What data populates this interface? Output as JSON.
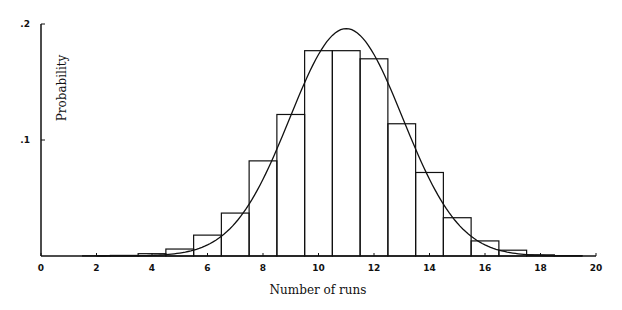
{
  "chart_data": {
    "type": "bar",
    "title": "",
    "xlabel": "Number of runs",
    "ylabel": "Probability",
    "xlim": [
      0,
      20
    ],
    "ylim": [
      0,
      0.2
    ],
    "x_ticks": [
      0,
      2,
      4,
      6,
      8,
      10,
      12,
      14,
      16,
      18,
      20
    ],
    "x_tick_labels": [
      "0",
      "2",
      "4",
      "6",
      "8",
      "10",
      "12",
      "14",
      "16",
      "18",
      "20"
    ],
    "y_ticks": [
      0.1,
      0.2
    ],
    "y_tick_labels": [
      ".1",
      ".2"
    ],
    "grid": false,
    "legend": null,
    "series": [
      {
        "name": "Observed histogram",
        "kind": "bar",
        "x": [
          2,
          3,
          4,
          5,
          6,
          7,
          8,
          9,
          10,
          11,
          12,
          13,
          14,
          15,
          16,
          17,
          18,
          19
        ],
        "values": [
          0.0002,
          0.0005,
          0.002,
          0.006,
          0.018,
          0.037,
          0.082,
          0.122,
          0.177,
          0.177,
          0.17,
          0.114,
          0.072,
          0.033,
          0.013,
          0.005,
          0.001,
          0.0003
        ]
      },
      {
        "name": "Normal approximation",
        "kind": "line",
        "x": [
          2,
          3,
          4,
          5,
          6,
          7,
          8,
          9,
          10,
          11,
          12,
          13,
          14,
          15,
          16,
          17,
          18,
          19,
          20
        ],
        "values": [
          0.0003,
          0.0012,
          0.004,
          0.01,
          0.022,
          0.045,
          0.081,
          0.124,
          0.168,
          0.196,
          0.168,
          0.124,
          0.081,
          0.045,
          0.022,
          0.01,
          0.004,
          0.0012,
          0.0003
        ]
      }
    ]
  }
}
